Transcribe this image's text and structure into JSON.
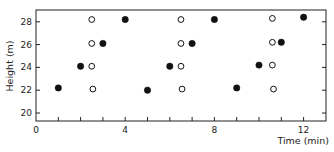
{
  "chart_data": {
    "type": "scatter",
    "title": "",
    "xlabel": "Time (min)",
    "ylabel": "Height (m)",
    "xlim": [
      0,
      13
    ],
    "ylim": [
      19.3,
      29.2
    ],
    "x_ticks": [
      0,
      4,
      8,
      12
    ],
    "x_minor_ticks": [
      1,
      2,
      3,
      5,
      6,
      7,
      9,
      10,
      11
    ],
    "y_ticks": [
      20,
      22,
      24,
      26,
      28
    ],
    "grid": false,
    "legend": "none",
    "series": [
      {
        "name": "filled",
        "marker": "filled-circle",
        "color": "#111111",
        "points": [
          [
            1,
            22.2
          ],
          [
            2,
            24.1
          ],
          [
            3,
            26.1
          ],
          [
            4,
            28.2
          ],
          [
            5,
            22.0
          ],
          [
            6,
            24.1
          ],
          [
            7,
            26.1
          ],
          [
            8,
            28.2
          ],
          [
            9,
            22.2
          ],
          [
            10,
            24.2
          ],
          [
            11,
            26.2
          ],
          [
            12,
            28.4
          ]
        ]
      },
      {
        "name": "open",
        "marker": "open-circle",
        "color": "#111111",
        "points": [
          [
            2.5,
            28.2
          ],
          [
            2.5,
            26.1
          ],
          [
            2.5,
            24.1
          ],
          [
            2.55,
            22.1
          ],
          [
            6.5,
            28.2
          ],
          [
            6.5,
            26.1
          ],
          [
            6.5,
            24.1
          ],
          [
            6.55,
            22.1
          ],
          [
            10.6,
            28.3
          ],
          [
            10.6,
            26.2
          ],
          [
            10.6,
            24.2
          ],
          [
            10.65,
            22.1
          ]
        ]
      }
    ]
  }
}
